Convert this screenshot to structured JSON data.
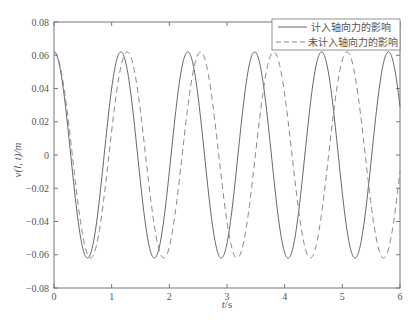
{
  "chart_data": {
    "type": "line",
    "title": "",
    "xlabel": "t/s",
    "ylabel": "v(l, t)/m",
    "xlim": [
      0,
      6
    ],
    "ylim": [
      -0.08,
      0.08
    ],
    "xticks": [
      0,
      1,
      2,
      3,
      4,
      5,
      6
    ],
    "xtick_labels": [
      "0",
      "1",
      "2",
      "3",
      "4",
      "5",
      "6"
    ],
    "yticks": [
      0.08,
      0.06,
      0.04,
      0.02,
      0,
      -0.02,
      -0.04,
      -0.06,
      -0.08
    ],
    "ytick_labels": [
      "0.08",
      "0.06",
      "0.04",
      "0.02",
      "0",
      "-0.02",
      "-0.04",
      "-0.06",
      "-0.08"
    ],
    "grid": false,
    "legend_position": "upper right",
    "series": [
      {
        "name": "计入轴向力的影响",
        "style": "solid",
        "color": "#666666",
        "function": "0.062*cos(2*pi*t/1.16)",
        "amplitude": 0.062,
        "period": 1.16,
        "peaks_t": [
          0,
          1.16,
          2.32,
          3.48,
          4.64,
          5.8
        ],
        "troughs_t": [
          0.58,
          1.74,
          2.9,
          4.06,
          5.22
        ]
      },
      {
        "name": "未计入轴向力的影响",
        "style": "dashed",
        "color": "#888888",
        "function": "0.062*cos(2*pi*t/1.27)",
        "amplitude": 0.062,
        "period": 1.27,
        "peaks_t": [
          0,
          1.27,
          2.54,
          3.81,
          5.08
        ],
        "troughs_t": [
          0.635,
          1.905,
          3.175,
          4.445,
          5.715
        ]
      }
    ]
  },
  "legend": {
    "items": [
      {
        "label": "计入轴向力的影响"
      },
      {
        "label": "未计入轴向力的影响"
      }
    ]
  },
  "axes": {
    "xlabel_italic": "t",
    "xlabel_unit": "/s",
    "ylabel": "v(l, t)/m"
  }
}
